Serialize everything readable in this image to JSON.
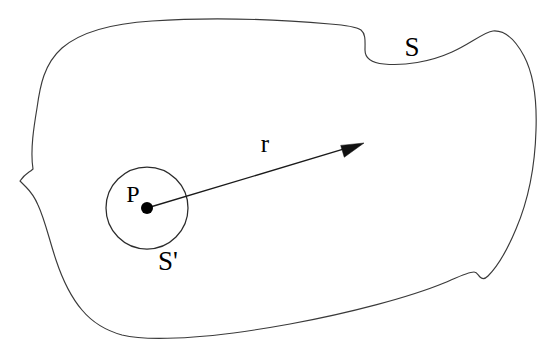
{
  "figure": {
    "background_color": "#ffffff",
    "stroke_color": "#3a3a3a",
    "label_color": "#000000",
    "labels": {
      "outer_surface": "S",
      "inner_surface": "S'",
      "point": "P",
      "radius_vector": "r"
    },
    "label_positions": {
      "outer_surface": {
        "x": 412,
        "y": 50
      },
      "inner_surface": {
        "x": 168,
        "y": 264
      },
      "point": {
        "x": 133,
        "y": 196
      },
      "radius_vector": {
        "x": 265,
        "y": 146
      }
    },
    "geometry": {
      "inner_circle": {
        "cx": 147,
        "cy": 208,
        "r": 41
      },
      "point_dot": {
        "cx": 147,
        "cy": 208,
        "r": 6
      },
      "radius_arrow": {
        "from_x": 147,
        "from_y": 208,
        "to_x": 364,
        "to_y": 143,
        "arrow_length": 23,
        "arrow_half_width": 8
      },
      "outer_outline": "M 33 169 C 30 150 34 126 37 108 C 40 86 44 64 62 48 C 84 29 120 23 152 21 C 210 17 272 19 330 24 C 344 25 355 26 361 30 C 366 34 365 42 365 50 C 365 58 372 63 384 64 C 404 66 430 62 452 52 C 470 44 484 32 493 31 C 505 30 516 41 524 56 C 534 75 537 101 536 130 C 535 166 528 201 516 229 C 506 253 496 268 488 276 C 485 279 482 279 480 277 C 478 275 477 272 474 272 C 468 272 458 277 444 283 C 410 297 350 313 290 324 C 246 332 206 337 176 338 C 152 339 134 338 122 335 C 104 330 92 322 82 310 C 70 296 62 278 56 260 C 49 239 45 220 38 205 C 35 198 31 192 26 187 C 23 184 21 182 20 181 C 22 178 26 174 29 172 C 31 171 32 170 33 169 Z"
    }
  }
}
